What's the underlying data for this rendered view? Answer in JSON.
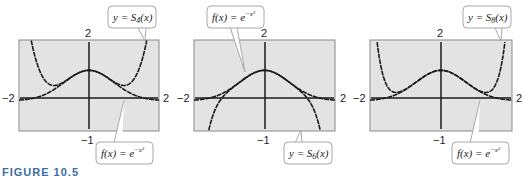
{
  "figure": {
    "caption": "FIGURE 10.5",
    "colors": {
      "plot_background": "#e3e3e3",
      "frame": "#8a8a8a",
      "curve": "#1a1a1a",
      "callout_border": "#a8a8a8",
      "caption": "#3a6ea5"
    }
  },
  "chart_data": [
    {
      "type": "line",
      "title": "",
      "xlim": [
        -2,
        2
      ],
      "ylim": [
        -1,
        2
      ],
      "tick_labels": {
        "x_min": "−2",
        "x_max": "2",
        "y_max": "2",
        "y_min": "−1"
      },
      "grid": false,
      "series": [
        {
          "name": "f(x) = e^(-x^2)",
          "label": "f(x) = e",
          "exp": "−x²",
          "function": "exp(-x^2)"
        },
        {
          "name": "y = S4(x)",
          "label": "y = S",
          "sub": "4",
          "tail": "(x)",
          "function": "1 - x^2 + x^4/2"
        }
      ],
      "callouts": [
        {
          "series": 1,
          "position": "top-right"
        },
        {
          "series": 0,
          "position": "bottom-right"
        }
      ]
    },
    {
      "type": "line",
      "title": "",
      "xlim": [
        -2,
        2
      ],
      "ylim": [
        -1,
        2
      ],
      "tick_labels": {
        "x_min": "−2",
        "x_max": "2",
        "y_max": "2",
        "y_min": "−1"
      },
      "grid": false,
      "series": [
        {
          "name": "f(x) = e^(-x^2)",
          "label": "f(x) = e",
          "exp": "−x²",
          "function": "exp(-x^2)"
        },
        {
          "name": "y = S6(x)",
          "label": "y = S",
          "sub": "6",
          "tail": "(x)",
          "function": "1 - x^2 + x^4/2 - x^6/6"
        }
      ],
      "callouts": [
        {
          "series": 0,
          "position": "top-left"
        },
        {
          "series": 1,
          "position": "bottom-right"
        }
      ]
    },
    {
      "type": "line",
      "title": "",
      "xlim": [
        -2,
        2
      ],
      "ylim": [
        -1,
        2
      ],
      "tick_labels": {
        "x_min": "−2",
        "x_max": "2",
        "y_max": "2",
        "y_min": "−1"
      },
      "grid": false,
      "series": [
        {
          "name": "f(x) = e^(-x^2)",
          "label": "f(x) = e",
          "exp": "−x²",
          "function": "exp(-x^2)"
        },
        {
          "name": "y = S8(x)",
          "label": "y = S",
          "sub": "8",
          "tail": "(x)",
          "function": "1 - x^2 + x^4/2 - x^6/6 + x^8/24"
        }
      ],
      "callouts": [
        {
          "series": 1,
          "position": "top-right"
        },
        {
          "series": 0,
          "position": "bottom-right"
        }
      ]
    }
  ]
}
